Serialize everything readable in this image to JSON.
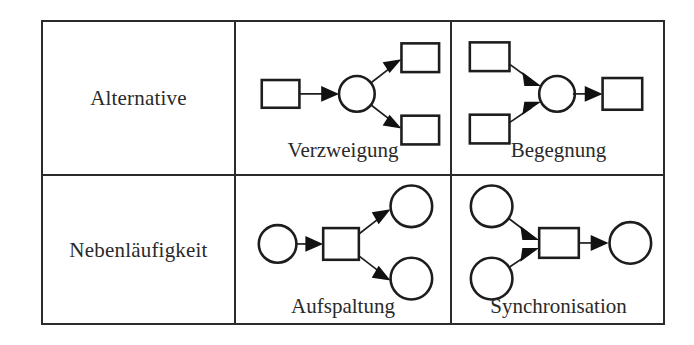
{
  "figure": {
    "type": "comparison-table",
    "columns": 3,
    "rows": 2,
    "language": "de",
    "rows_data": [
      {
        "header": "Alternative",
        "cells": [
          {
            "caption": "Verzweigung",
            "pattern": "one-rectangle-to-circle-to-two-rectangles",
            "node_shapes": [
              "rectangle",
              "circle",
              "rectangle",
              "rectangle"
            ],
            "arrow_count": 3
          },
          {
            "caption": "Begegnung",
            "pattern": "two-rectangles-to-circle-to-one-rectangle",
            "node_shapes": [
              "rectangle",
              "rectangle",
              "circle",
              "rectangle"
            ],
            "arrow_count": 3
          }
        ]
      },
      {
        "header": "Nebenläufigkeit",
        "cells": [
          {
            "caption": "Aufspaltung",
            "pattern": "one-circle-to-rectangle-to-two-circles",
            "node_shapes": [
              "circle",
              "rectangle",
              "circle",
              "circle"
            ],
            "arrow_count": 3
          },
          {
            "caption": "Synchronisation",
            "pattern": "two-circles-to-rectangle-to-one-circle",
            "node_shapes": [
              "circle",
              "circle",
              "rectangle",
              "circle"
            ],
            "arrow_count": 3
          }
        ]
      }
    ]
  },
  "colors": {
    "stroke": "#1d1d1d",
    "border": "#2b2b2b",
    "text": "#2a2a2a",
    "background": "#ffffff"
  }
}
